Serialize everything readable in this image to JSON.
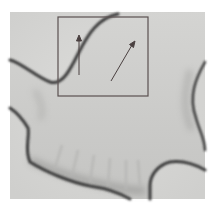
{
  "figure": {
    "colors": {
      "background": "#ffffff",
      "field": "#d6d6d4",
      "outline": "#3a3a3a",
      "box": "#5a5050",
      "arrow": "#4a4040"
    },
    "annotations": {
      "box": {
        "x": 58,
        "y": 17,
        "width": 90,
        "height": 79
      },
      "arrows": [
        {
          "from": [
            79,
            75
          ],
          "to": [
            79,
            36
          ]
        },
        {
          "from": [
            111,
            81
          ],
          "to": [
            134,
            42
          ]
        }
      ]
    }
  }
}
